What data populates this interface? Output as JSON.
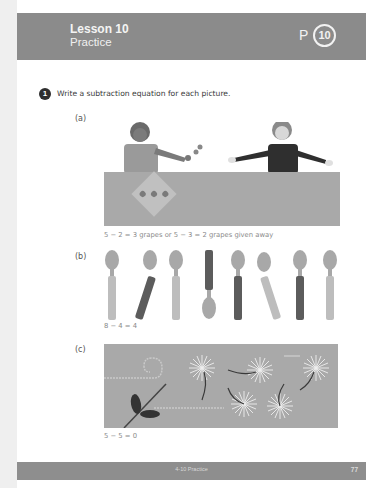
{
  "header": {
    "lesson_title": "Lesson 10",
    "lesson_subtitle": "Practice",
    "p_label": "P",
    "p_number": "10"
  },
  "question": {
    "number": "1",
    "text": "Write a subtraction equation for each picture."
  },
  "parts": [
    {
      "label": "(a)",
      "picture": "Two children at a table; one gives grapes to the other, a card with 3 grapes lies on the table",
      "answer": "5 − 2 = 3 grapes or 5 − 3 = 2 grapes given away"
    },
    {
      "label": "(b)",
      "picture": "8 spoons, 4 with dark handles",
      "answer": "8 − 4 = 4"
    },
    {
      "label": "(c)",
      "picture": "5 dandelion seed heads blowing away in the wind",
      "answer": "5 − 5 = 0"
    }
  ],
  "footer": {
    "label": "4-10 Practice",
    "page_number": "77"
  },
  "colors": {
    "header_bg": "#8b8b8b",
    "footer_bg": "#8e8e8e",
    "picture_bg": "#a9a9a9",
    "answer_text": "#8a8a8a"
  }
}
